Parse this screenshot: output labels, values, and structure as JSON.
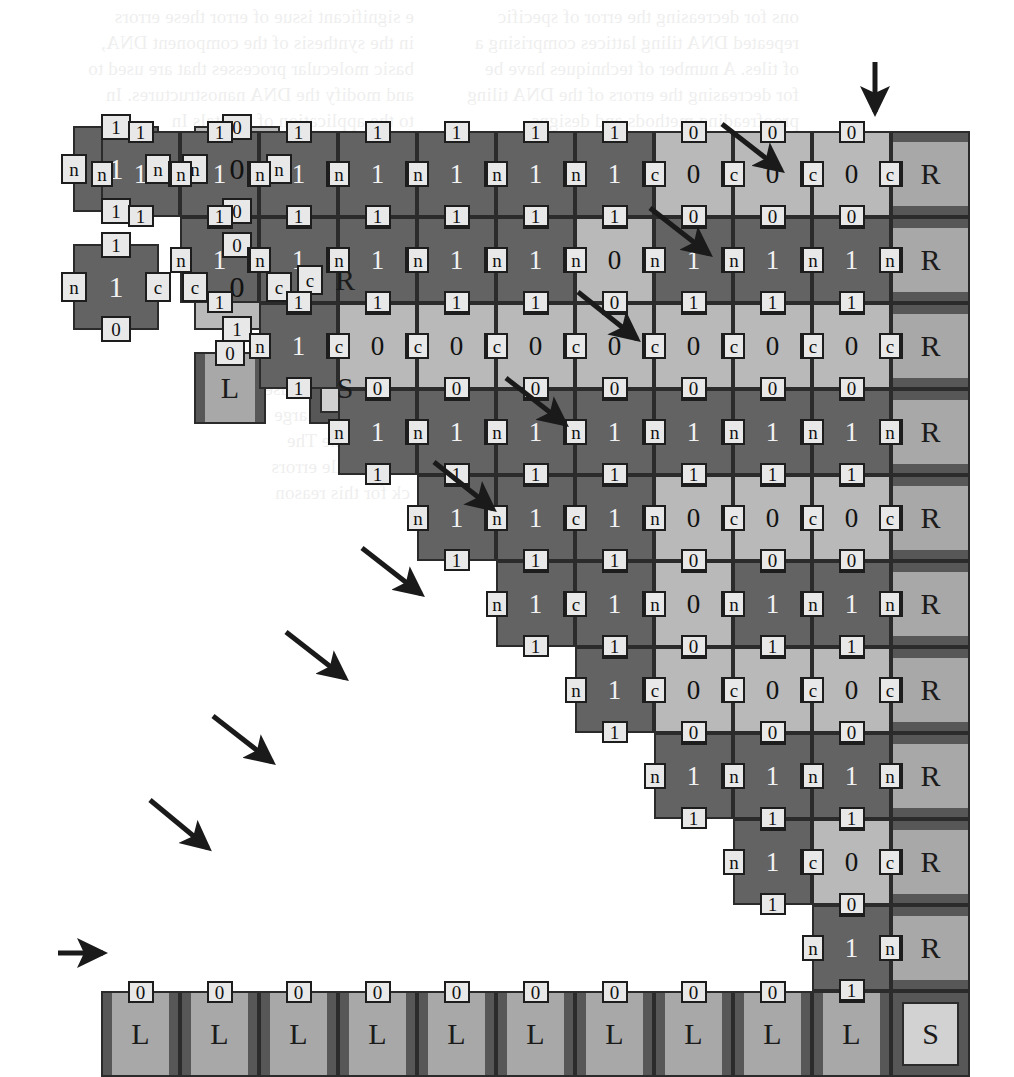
{
  "figure": {
    "colors": {
      "dark_tile": "#636363",
      "light_tile": "#b9b9b9",
      "border_tile": "#a8a8a8",
      "border_stripe": "#575757",
      "seed_fill": "#d2d2d2",
      "outline": "#2b2b2b",
      "label_chip": "#e8e8e8",
      "arrow": "#1a1a1a",
      "page": "#ffffff"
    },
    "grid": {
      "columns": 11,
      "rows": 11,
      "cell_w": 79,
      "cell_h": 86,
      "origin_x": 101,
      "origin_y": 131
    }
  },
  "legend": {
    "caption": "",
    "tiles": [
      {
        "id": "rule-tile-11-1",
        "kind": "dark",
        "center": "1",
        "top": "1",
        "right": "n",
        "bottom": "1",
        "left": "n",
        "x": 73,
        "y": 126
      },
      {
        "id": "rule-tile-00-0",
        "kind": "light",
        "center": "0",
        "top": "0",
        "right": "n",
        "bottom": "0",
        "left": "n",
        "x": 194,
        "y": 126
      },
      {
        "id": "rule-tile-10-1c",
        "kind": "dark",
        "center": "1",
        "top": "1",
        "right": "c",
        "bottom": "0",
        "left": "n",
        "x": 73,
        "y": 244
      },
      {
        "id": "rule-tile-01-0c",
        "kind": "light",
        "center": "0",
        "top": "0",
        "right": "c",
        "bottom": "1",
        "left": "c",
        "x": 194,
        "y": 244
      },
      {
        "id": "border-tile-R",
        "kind": "R",
        "center": "R",
        "left": "c",
        "x": 309,
        "y": 244
      },
      {
        "id": "border-tile-L",
        "kind": "L",
        "center": "L",
        "top": "0",
        "x": 194,
        "y": 352
      },
      {
        "id": "seed-tile-S",
        "kind": "S",
        "center": "S",
        "x": 309,
        "y": 352
      }
    ]
  },
  "assembly": {
    "description": "Staircase self-assembly of an 11x11 tile region: bottom row of L border tiles with an S seed at the right, right column of R border tiles, and a triangular binary-counter region of dark (1) and light (0) rule tiles.",
    "column_order_note": "Column 0 is leftmost; column 10 is the rightmost border column.",
    "row_order_note": "Row 0 is the bottom-most (L/S) row; row 10 is the topmost.",
    "bottom_row": {
      "left_tiles": [
        "L",
        "L",
        "L",
        "L",
        "L",
        "L",
        "L",
        "L",
        "L",
        "L"
      ],
      "left_tile_top_label": "0",
      "seed_tile": "S"
    },
    "right_column": {
      "tiles": [
        "R",
        "R",
        "R",
        "R",
        "R",
        "R",
        "R",
        "R",
        "R",
        "R"
      ],
      "left_label": "c"
    },
    "counter_rows": [
      {
        "row": 1,
        "bits": [
          "0",
          "0",
          "0",
          "0",
          "0",
          "0",
          "0",
          "0",
          "0",
          "1"
        ]
      },
      {
        "row": 2,
        "bits": [
          "0",
          "0",
          "0",
          "0",
          "0",
          "0",
          "0",
          "0",
          "1",
          "0"
        ]
      },
      {
        "row": 3,
        "bits": [
          "0",
          "0",
          "0",
          "0",
          "0",
          "0",
          "0",
          "1",
          "1",
          "1"
        ]
      },
      {
        "row": 4,
        "bits": [
          "0",
          "0",
          "0",
          "0",
          "0",
          "0",
          "1",
          "0",
          "0",
          "0"
        ]
      },
      {
        "row": 5,
        "bits": [
          "0",
          "0",
          "0",
          "0",
          "0",
          "1",
          "1",
          "0",
          "1",
          "1"
        ]
      },
      {
        "row": 6,
        "bits": [
          "0",
          "0",
          "0",
          "0",
          "1",
          "1",
          "1",
          "0",
          "0",
          "0"
        ]
      },
      {
        "row": 7,
        "bits": [
          "0",
          "0",
          "0",
          "1",
          "1",
          "1",
          "1",
          "1",
          "1",
          "1"
        ]
      },
      {
        "row": 8,
        "bits": [
          "0",
          "0",
          "1",
          "0",
          "0",
          "0",
          "0",
          "0",
          "0",
          "0"
        ]
      },
      {
        "row": 9,
        "bits": [
          "0",
          "1",
          "1",
          "1",
          "1",
          "1",
          "0",
          "1",
          "1",
          "1"
        ]
      },
      {
        "row": 10,
        "bits": [
          "1",
          "1",
          "1",
          "1",
          "1",
          "1",
          "1",
          "0",
          "0",
          "0"
        ]
      }
    ],
    "edge_labels": {
      "zero_tile": {
        "top": "0",
        "bottom": "0",
        "left": "n",
        "right": "n"
      },
      "one_tile": {
        "top": "1",
        "bottom": "1",
        "left": "n",
        "right": "n"
      },
      "carry_left": "c",
      "no_carry_left": "n"
    }
  },
  "arrows": {
    "count": 11,
    "meaning": "growth-direction pointers indicating the order in which successive rows of the assembly are added",
    "items": [
      {
        "id": "arrow-seed-row",
        "x1": 58,
        "y1": 953,
        "x2": 103,
        "y2": 953
      },
      {
        "id": "arrow-row-1",
        "x1": 150,
        "y1": 800,
        "x2": 208,
        "y2": 848
      },
      {
        "id": "arrow-row-2",
        "x1": 213,
        "y1": 716,
        "x2": 272,
        "y2": 762
      },
      {
        "id": "arrow-row-3",
        "x1": 286,
        "y1": 632,
        "x2": 345,
        "y2": 678
      },
      {
        "id": "arrow-row-4",
        "x1": 362,
        "y1": 548,
        "x2": 421,
        "y2": 594
      },
      {
        "id": "arrow-row-5",
        "x1": 434,
        "y1": 462,
        "x2": 493,
        "y2": 509
      },
      {
        "id": "arrow-row-6",
        "x1": 506,
        "y1": 378,
        "x2": 565,
        "y2": 424
      },
      {
        "id": "arrow-row-7",
        "x1": 578,
        "y1": 292,
        "x2": 637,
        "y2": 339
      },
      {
        "id": "arrow-row-8",
        "x1": 650,
        "y1": 208,
        "x2": 709,
        "y2": 254
      },
      {
        "id": "arrow-row-9",
        "x1": 722,
        "y1": 124,
        "x2": 781,
        "y2": 170
      },
      {
        "id": "arrow-row-10",
        "x1": 875,
        "y1": 62,
        "x2": 875,
        "y2": 112
      }
    ]
  },
  "bleed_text": {
    "note": "faint mirrored show-through from the reverse side of the printed page; not primary content",
    "lines": [
      {
        "t": "ons for decreasing the error of specific",
        "x": 215,
        "y": 2
      },
      {
        "t": "repeated DNA tiling lattices comprising a",
        "x": 215,
        "y": 28
      },
      {
        "t": "of tiles. A number of techniques have be",
        "x": 215,
        "y": 54
      },
      {
        "t": "for decreasing the errors of the DNA tiling",
        "x": 215,
        "y": 80
      },
      {
        "t": "proofreading methods and designs",
        "x": 215,
        "y": 106
      },
      {
        "t": "e significant issue of error  these errors",
        "x": 600,
        "y": 2
      },
      {
        "t": "in the synthesis of the component DNA,",
        "x": 600,
        "y": 28
      },
      {
        "t": "basic molecular processes that are used to",
        "x": 600,
        "y": 54
      },
      {
        "t": "and modify the DNA nanostructures. In",
        "x": 600,
        "y": 80
      },
      {
        "t": "to the application of  crystals  In",
        "x": 600,
        "y": 106
      },
      {
        "t": "self-assembly, there are three small-scale",
        "x": 600,
        "y": 132
      },
      {
        "t": "16.2.2   Proofreading Schemes for",
        "x": 212,
        "y": 218
      },
      {
        "t": "Tiling Assemblies",
        "x": 250,
        "y": 250
      },
      {
        "t": "Winfree and Bekbolatov [17] developed a",
        "x": 212,
        "y": 286
      },
      {
        "t": "reading method of replacing each tile with",
        "x": 212,
        "y": 312
      },
      {
        "t": "that provides for similar redundancy to",
        "x": 212,
        "y": 338
      },
      {
        "t": "reduce errors in the DNA tiling assemblies",
        "x": 212,
        "y": 364
      },
      {
        "t": "replaced by an array of k x k tiles that is",
        "x": 212,
        "y": 390
      },
      {
        "t": "corresponds to the original tile. The interior si",
        "x": 212,
        "y": 416
      },
      {
        "t": "of these k x k blocks are given unique glues that",
        "x": 212,
        "y": 442
      },
      {
        "t": "with each other tile. Thus the assembly process",
        "x": 212,
        "y": 468
      },
      {
        "t": "nanostructures are",
        "x": 604,
        "y": 270
      },
      {
        "t": "tions and the DNA",
        "x": 604,
        "y": 296
      },
      {
        "t": "structured tiles are",
        "x": 604,
        "y": 322
      },
      {
        "t": "ds to multiple tiles",
        "x": 604,
        "y": 348
      },
      {
        "t": "assembly. Because",
        "x": 604,
        "y": 374
      },
      {
        "t": "e assembles large",
        "x": 604,
        "y": 400
      },
      {
        "t": "error-prone  The",
        "x": 604,
        "y": 426
      },
      {
        "t": "rates of tile errors",
        "x": 604,
        "y": 452
      },
      {
        "t": "ck for this reason",
        "x": 604,
        "y": 478
      },
      {
        "t": "Proofreading schemes that replace each tile in a tiling with a set of tiles.",
        "x": 78,
        "y": 1008
      }
    ]
  }
}
